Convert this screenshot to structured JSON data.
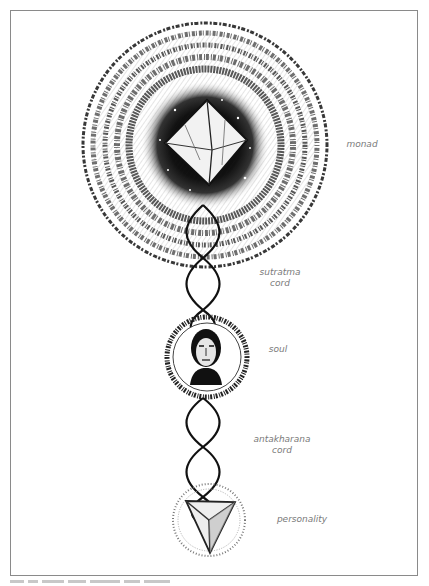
{
  "figure": {
    "labels": {
      "monad": "monad",
      "sutratma": [
        "sutratma",
        "cord"
      ],
      "soul": "soul",
      "antakharana": [
        "antakharana",
        "cord"
      ],
      "personality": "personality"
    },
    "elements": [
      {
        "name": "monad",
        "symbol": "octahedron within radiant sphere"
      },
      {
        "name": "sutratma-cord",
        "symbol": "double-helix cord"
      },
      {
        "name": "soul",
        "symbol": "human head within radiant circle"
      },
      {
        "name": "antakharana-cord",
        "symbol": "double-helix cord"
      },
      {
        "name": "personality",
        "symbol": "tetrahedron within stippled circle"
      }
    ],
    "colors": {
      "ink": "#111111",
      "label": "#7a7a7a",
      "frame": "#8a8a8a",
      "paper": "#ffffff"
    }
  }
}
